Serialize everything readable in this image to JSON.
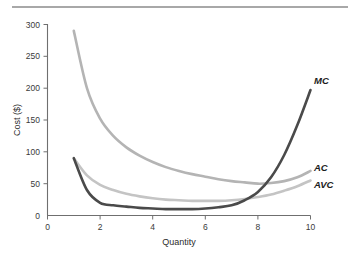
{
  "figure": {
    "background_color": "#ffffff",
    "top_rule_color": "#a8a8a8"
  },
  "chart_data": {
    "type": "line",
    "title": "",
    "subtitle": "",
    "xlabel": "Quantity",
    "ylabel": "Cost ($)",
    "xlim": [
      0,
      10
    ],
    "ylim": [
      0,
      300
    ],
    "xticks": [
      "0",
      "2",
      "4",
      "6",
      "8",
      "10"
    ],
    "xtick_values": [
      0,
      2,
      4,
      6,
      8,
      10
    ],
    "yticks": [
      "0",
      "50",
      "100",
      "150",
      "200",
      "250",
      "300"
    ],
    "ytick_values": [
      0,
      50,
      100,
      150,
      200,
      250,
      300
    ],
    "grid": false,
    "legend_position": "right-inline-labels",
    "x": [
      1,
      1.5,
      2,
      2.5,
      3,
      3.5,
      4,
      4.5,
      5,
      5.5,
      6,
      6.5,
      7,
      7.5,
      8,
      8.5,
      9,
      9.5,
      10
    ],
    "series": [
      {
        "name": "MC",
        "label": "MC",
        "color": "#4a4a4a",
        "linewidth": 2.6,
        "values": [
          90,
          40,
          20,
          16,
          14,
          12,
          11,
          10,
          10,
          10,
          11,
          13,
          16,
          24,
          37,
          60,
          95,
          142,
          197
        ]
      },
      {
        "name": "AC",
        "label": "AC",
        "color": "#b4b4b4",
        "linewidth": 2.6,
        "values": [
          290,
          200,
          152,
          125,
          107,
          94,
          84,
          76,
          70,
          65,
          61,
          57,
          54,
          52,
          50,
          51,
          54,
          60,
          70
        ]
      },
      {
        "name": "AVC",
        "label": "AVC",
        "color": "#c4c4c4",
        "linewidth": 2.6,
        "values": [
          90,
          63,
          48,
          40,
          34,
          30,
          27,
          25,
          24,
          23,
          23,
          23,
          24,
          26,
          29,
          33,
          39,
          46,
          55
        ]
      }
    ],
    "annotations": [
      {
        "text": "MC",
        "x": 10.1,
        "y": 210,
        "style": "bold-italic"
      },
      {
        "text": "AC",
        "x": 10.1,
        "y": 78,
        "style": "bold-italic"
      },
      {
        "text": "AVC",
        "x": 10.1,
        "y": 52,
        "style": "bold-italic"
      }
    ]
  }
}
